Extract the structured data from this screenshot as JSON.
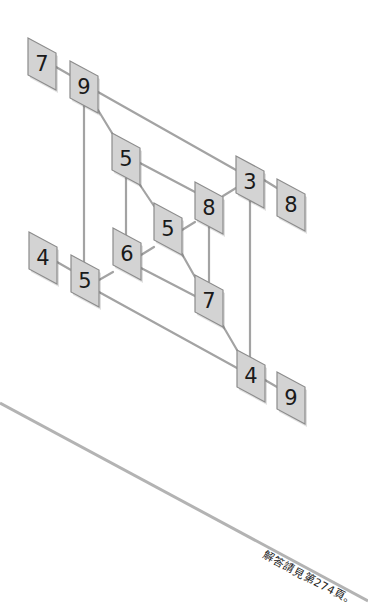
{
  "puzzle": {
    "box_width": 28,
    "box_height": 37,
    "box_skew": 15,
    "colors": {
      "box_fill": "#d3d3d3",
      "box_border": "#8c8c8c",
      "connector": "#a3a3a3",
      "digit": "#1a1a1a",
      "divider": "#b3b3b3"
    },
    "nodes": [
      {
        "id": "n7a",
        "value": "7",
        "x": 28,
        "y": 38
      },
      {
        "id": "n9a",
        "value": "9",
        "x": 70,
        "y": 61
      },
      {
        "id": "n5a",
        "value": "5",
        "x": 112,
        "y": 133
      },
      {
        "id": "n8a",
        "value": "8",
        "x": 195,
        "y": 182
      },
      {
        "id": "n3",
        "value": "3",
        "x": 236,
        "y": 156
      },
      {
        "id": "n8b",
        "value": "8",
        "x": 277,
        "y": 179
      },
      {
        "id": "n5b",
        "value": "5",
        "x": 154,
        "y": 203
      },
      {
        "id": "n6",
        "value": "6",
        "x": 113,
        "y": 228
      },
      {
        "id": "n4a",
        "value": "4",
        "x": 29,
        "y": 232
      },
      {
        "id": "n5c",
        "value": "5",
        "x": 71,
        "y": 255
      },
      {
        "id": "n7b",
        "value": "7",
        "x": 195,
        "y": 275
      },
      {
        "id": "n4b",
        "value": "4",
        "x": 237,
        "y": 350
      },
      {
        "id": "n9b",
        "value": "9",
        "x": 277,
        "y": 372
      }
    ],
    "connectors": [
      {
        "from": [
          56,
          67
        ],
        "to": [
          70,
          75
        ]
      },
      {
        "from": [
          98,
          92
        ],
        "to": [
          236,
          170
        ]
      },
      {
        "from": [
          98,
          110
        ],
        "to": [
          112,
          133
        ]
      },
      {
        "from": [
          84,
          105
        ],
        "to": [
          84,
          262
        ]
      },
      {
        "from": [
          140,
          163
        ],
        "to": [
          195,
          192
        ]
      },
      {
        "from": [
          126,
          178
        ],
        "to": [
          126,
          235
        ]
      },
      {
        "from": [
          140,
          185
        ],
        "to": [
          154,
          206
        ]
      },
      {
        "from": [
          182,
          230
        ],
        "to": [
          195,
          222
        ]
      },
      {
        "from": [
          223,
          196
        ],
        "to": [
          236,
          188
        ]
      },
      {
        "from": [
          264,
          180
        ],
        "to": [
          277,
          188
        ]
      },
      {
        "from": [
          209,
          227
        ],
        "to": [
          209,
          282
        ]
      },
      {
        "from": [
          250,
          200
        ],
        "to": [
          250,
          357
        ]
      },
      {
        "from": [
          182,
          254
        ],
        "to": [
          195,
          277
        ]
      },
      {
        "from": [
          141,
          255
        ],
        "to": [
          154,
          247
        ]
      },
      {
        "from": [
          99,
          280
        ],
        "to": [
          113,
          272
        ]
      },
      {
        "from": [
          141,
          268
        ],
        "to": [
          195,
          296
        ]
      },
      {
        "from": [
          57,
          262
        ],
        "to": [
          71,
          270
        ]
      },
      {
        "from": [
          99,
          292
        ],
        "to": [
          237,
          368
        ]
      },
      {
        "from": [
          223,
          326
        ],
        "to": [
          237,
          350
        ]
      },
      {
        "from": [
          265,
          380
        ],
        "to": [
          277,
          387
        ]
      }
    ]
  },
  "divider": {
    "x1": 0,
    "y1": 403,
    "x2": 368,
    "y2": 601
  },
  "footer": {
    "answer_note": "解答請見第274頁。"
  }
}
